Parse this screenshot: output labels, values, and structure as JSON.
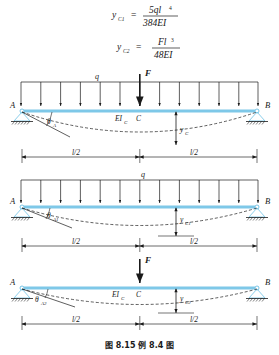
{
  "figure": {
    "caption": "图 8.15  例 8.4 图",
    "beam_color": "#7ec8e8",
    "line_color": "#1a1a1a"
  },
  "formulas": [
    {
      "id": "formula-1",
      "lhs": "y",
      "lhs_sub": "C1",
      "eq": "=",
      "numerator": "5ql",
      "numerator_exp": "4",
      "denominator": "384EI"
    },
    {
      "id": "formula-2",
      "lhs": "y",
      "lhs_sub": "C2",
      "eq": "=",
      "numerator": "Fl",
      "numerator_exp": "3",
      "denominator": "48EI"
    }
  ],
  "diagrams": [
    {
      "id": "beam-combined",
      "label_A": "A",
      "label_B": "B",
      "label_C": "C",
      "label_q": "q",
      "label_F": "F",
      "label_EI": "EI",
      "label_EI_sub": "C",
      "label_theta": "θ",
      "label_theta_sub": "A",
      "label_y": "y",
      "label_y_sub": "C",
      "dim_left": "l/2",
      "dim_right": "l/2",
      "has_udl": true,
      "has_point_load": true
    },
    {
      "id": "beam-udl",
      "label_A": "A",
      "label_B": "B",
      "label_q": "q",
      "label_theta": "θ",
      "label_theta_sub": "A1",
      "label_y": "y",
      "label_y_sub": "C1",
      "dim_left": "l/2",
      "dim_right": "l/2",
      "has_udl": true,
      "has_point_load": false
    },
    {
      "id": "beam-point-load",
      "label_A": "A",
      "label_B": "B",
      "label_C": "C",
      "label_F": "F",
      "label_EI": "EI",
      "label_EI_sub": "C",
      "label_theta": "θ",
      "label_theta_sub": "A2",
      "label_y": "y",
      "label_y_sub": "C2",
      "dim_left": "l/2",
      "dim_right": "l/2",
      "has_udl": false,
      "has_point_load": true
    }
  ]
}
